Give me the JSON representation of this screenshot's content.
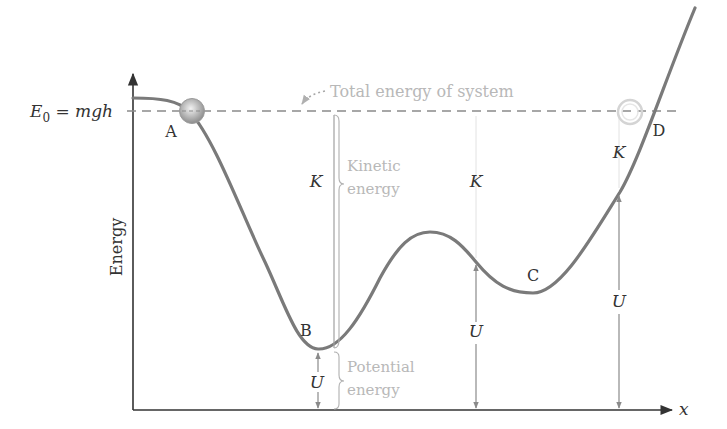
{
  "diagram": {
    "type": "potential-energy-curve",
    "axes": {
      "y_label": "Energy",
      "x_label": "x",
      "origin": [
        133,
        410
      ],
      "y_axis_top": 72,
      "x_axis_right": 672
    },
    "total_energy": {
      "label": "E",
      "subscript": "0",
      "equation": " = mgh",
      "annotation": "Total energy of system",
      "y": 111
    },
    "points": [
      {
        "id": "A",
        "label": "A",
        "x": 171,
        "y": 136
      },
      {
        "id": "B",
        "label": "B",
        "x": 306,
        "y": 335
      },
      {
        "id": "C",
        "label": "C",
        "x": 533,
        "y": 280
      },
      {
        "id": "D",
        "label": "D",
        "x": 657,
        "y": 135
      }
    ],
    "kinetic": {
      "symbol": "K",
      "brace_label_line1": "Kinetic",
      "brace_label_line2": "energy",
      "markers": [
        {
          "x": 316,
          "y": 187
        },
        {
          "x": 476,
          "y": 187
        },
        {
          "x": 619,
          "y": 158
        }
      ]
    },
    "potential": {
      "symbol": "U",
      "brace_label_line1": "Potential",
      "brace_label_line2": "energy",
      "markers": [
        {
          "x": 316,
          "y": 388
        },
        {
          "x": 476,
          "y": 337
        },
        {
          "x": 619,
          "y": 307
        }
      ]
    },
    "colors": {
      "curve": "#7a7a7a",
      "axis": "#333333",
      "dashed": "#888888",
      "light_text": "#b8b8b8",
      "ball": "#9a9a9a",
      "ghost_ball": "#d6d6d6"
    }
  }
}
